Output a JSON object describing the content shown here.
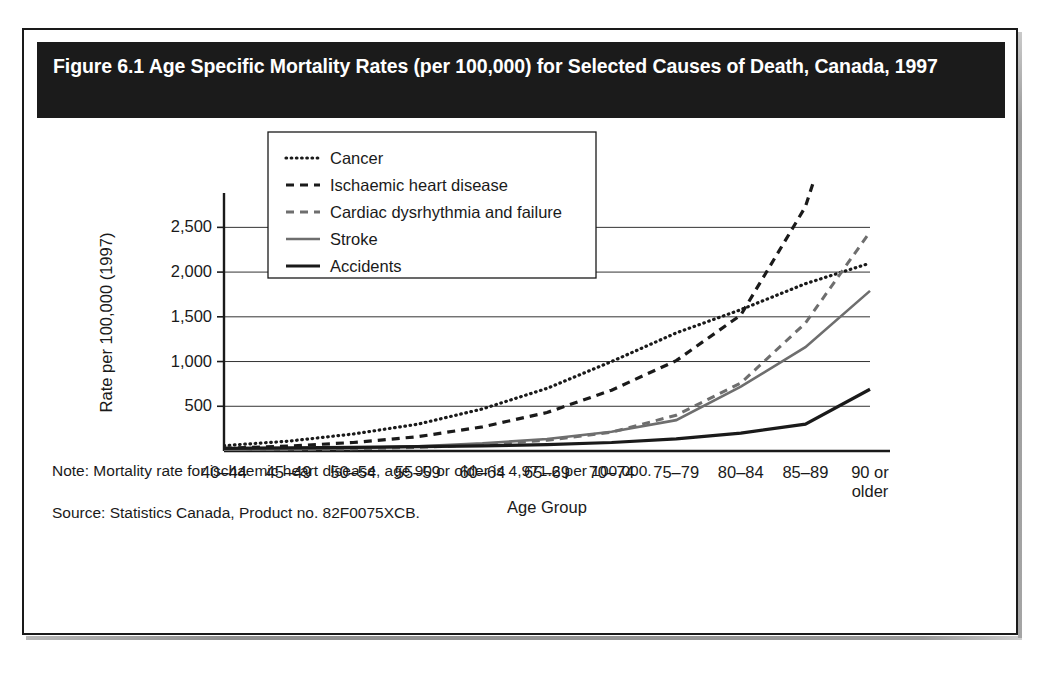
{
  "figure": {
    "title": "Figure 6.1 Age Specific Mortality Rates (per 100,000) for Selected Causes of Death, Canada, 1997",
    "note": "Note: Mortality rate for ischaemic heart disease, age 90 or older is 4,971.2 per 100,000.",
    "source": "Source: Statistics Canada, Product no. 82F0075XCB."
  },
  "chart_data": {
    "type": "line",
    "title": "Figure 6.1 Age Specific Mortality Rates (per 100,000) for Selected Causes of Death, Canada, 1997",
    "xlabel": "Age Group",
    "ylabel": "Rate per 100,000 (1997)",
    "categories": [
      "40–44",
      "45–49",
      "50–54",
      "55–59",
      "60–64",
      "65–69",
      "70–74",
      "75–79",
      "80–84",
      "85–89",
      "90 or\nolder"
    ],
    "ylim": [
      0,
      2750
    ],
    "yticks": [
      500,
      1000,
      1500,
      2000,
      2500
    ],
    "ytick_labels": [
      "500",
      "1,000",
      "1,500",
      "2,000",
      "2,500"
    ],
    "grid": "horizontal",
    "legend_position": "upper-left-inside",
    "clipped_note": "Ischaemic heart disease at 90 or older is 4,971.2, above the plotted y-axis range.",
    "series": [
      {
        "name": "Cancer",
        "style": "dotted",
        "color": "#1a1a1a",
        "values": [
          60,
          110,
          190,
          300,
          470,
          700,
          1000,
          1320,
          1580,
          1870,
          2100
        ]
      },
      {
        "name": "Ischaemic heart disease",
        "style": "dashed",
        "color": "#1a1a1a",
        "values": [
          30,
          55,
          95,
          160,
          270,
          430,
          680,
          1010,
          1520,
          2730,
          4971.2
        ]
      },
      {
        "name": "Cardiac dysrhythmia and failure",
        "style": "dashed-light",
        "color": "#6e6e6e",
        "values": [
          8,
          14,
          24,
          40,
          70,
          120,
          210,
          400,
          760,
          1430,
          2450
        ]
      },
      {
        "name": "Stroke",
        "style": "solid-gray",
        "color": "#6e6e6e",
        "values": [
          12,
          20,
          32,
          52,
          85,
          135,
          215,
          345,
          720,
          1160,
          1790
        ]
      },
      {
        "name": "Accidents",
        "style": "solid-black",
        "color": "#1a1a1a",
        "values": [
          30,
          34,
          40,
          48,
          58,
          72,
          95,
          135,
          200,
          300,
          690
        ]
      }
    ]
  }
}
